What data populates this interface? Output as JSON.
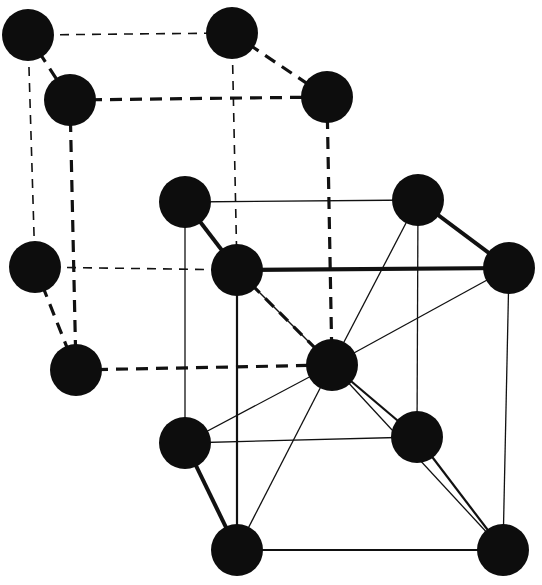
{
  "diagram": {
    "title": "",
    "atom_color": "#0d0d0d",
    "atom_radius": 26,
    "atoms": [
      {
        "id": "a1",
        "cell": "dashed",
        "x": 28,
        "y": 35
      },
      {
        "id": "a2",
        "cell": "dashed",
        "x": 232,
        "y": 33
      },
      {
        "id": "a3",
        "cell": "dashed",
        "x": 70,
        "y": 100
      },
      {
        "id": "a4",
        "cell": "dashed",
        "x": 327,
        "y": 97
      },
      {
        "id": "a5",
        "cell": "dashed",
        "x": 35,
        "y": 267
      },
      {
        "id": "a6",
        "cell": "dashed",
        "x": 76,
        "y": 370
      },
      {
        "id": "b1",
        "cell": "solid",
        "x": 185,
        "y": 202
      },
      {
        "id": "b2",
        "cell": "solid",
        "x": 237,
        "y": 270
      },
      {
        "id": "b3",
        "cell": "solid",
        "x": 418,
        "y": 200
      },
      {
        "id": "b4",
        "cell": "solid",
        "x": 509,
        "y": 268
      },
      {
        "id": "c",
        "cell": "center",
        "x": 332,
        "y": 365
      },
      {
        "id": "b5",
        "cell": "solid",
        "x": 185,
        "y": 443
      },
      {
        "id": "b6",
        "cell": "solid",
        "x": 417,
        "y": 437
      },
      {
        "id": "b7",
        "cell": "solid",
        "x": 237,
        "y": 550
      },
      {
        "id": "b8",
        "cell": "solid",
        "x": 503,
        "y": 550
      }
    ],
    "bonds": [
      {
        "from": "a1",
        "to": "a2",
        "style": "dashed-thin"
      },
      {
        "from": "a1",
        "to": "a3",
        "style": "dashed-thick"
      },
      {
        "from": "a2",
        "to": "a4",
        "style": "dashed-thick"
      },
      {
        "from": "a3",
        "to": "a4",
        "style": "dashed-thick"
      },
      {
        "from": "a1",
        "to": "a5",
        "style": "dashed-thin"
      },
      {
        "from": "a3",
        "to": "a6",
        "style": "dashed-thick"
      },
      {
        "from": "a2",
        "to": "b2",
        "style": "dashed-thin"
      },
      {
        "from": "a4",
        "to": "c",
        "style": "dashed-thick"
      },
      {
        "from": "a5",
        "to": "b2",
        "style": "dashed-thin"
      },
      {
        "from": "a5",
        "to": "a6",
        "style": "dashed-thick"
      },
      {
        "from": "a6",
        "to": "c",
        "style": "dashed-thick"
      },
      {
        "from": "b2",
        "to": "c",
        "style": "dashed-thick"
      },
      {
        "from": "b1",
        "to": "b3",
        "style": "solid-thin"
      },
      {
        "from": "b1",
        "to": "b2",
        "style": "solid-thick"
      },
      {
        "from": "b3",
        "to": "b4",
        "style": "solid-thick"
      },
      {
        "from": "b2",
        "to": "b4",
        "style": "solid-thick"
      },
      {
        "from": "b1",
        "to": "b5",
        "style": "solid-thin"
      },
      {
        "from": "b2",
        "to": "b7",
        "style": "solid-med"
      },
      {
        "from": "b3",
        "to": "b6",
        "style": "solid-thin"
      },
      {
        "from": "b4",
        "to": "b8",
        "style": "solid-thin"
      },
      {
        "from": "b5",
        "to": "b6",
        "style": "solid-thin"
      },
      {
        "from": "b5",
        "to": "b7",
        "style": "solid-thick"
      },
      {
        "from": "b6",
        "to": "b8",
        "style": "solid-med"
      },
      {
        "from": "b7",
        "to": "b8",
        "style": "solid-med"
      },
      {
        "from": "c",
        "to": "b2",
        "style": "solid-thin"
      },
      {
        "from": "c",
        "to": "b3",
        "style": "solid-thin"
      },
      {
        "from": "c",
        "to": "b4",
        "style": "solid-thin"
      },
      {
        "from": "c",
        "to": "b5",
        "style": "solid-thin"
      },
      {
        "from": "c",
        "to": "b6",
        "style": "solid-med"
      },
      {
        "from": "c",
        "to": "b7",
        "style": "solid-thin"
      },
      {
        "from": "c",
        "to": "b8",
        "style": "solid-thin"
      }
    ]
  }
}
